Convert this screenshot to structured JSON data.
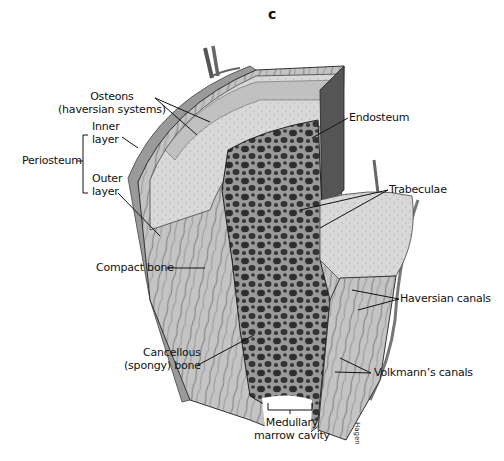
{
  "figure": {
    "panel_letter": "c",
    "colors": {
      "background": "#ffffff",
      "compact_bone": "#c9c9c9",
      "cut_surface": "#dcdcdc",
      "spongy_dark": "#3a3a3a",
      "periosteum": "#8a8a8a",
      "leader_lines": "#111111"
    }
  },
  "labels": {
    "osteons": {
      "line1": "Osteons",
      "line2": "(haversian systems)"
    },
    "periosteum": "Periosteum",
    "inner_layer": {
      "line1": "Inner",
      "line2": "layer"
    },
    "outer_layer": {
      "line1": "Outer",
      "line2": "layer"
    },
    "endosteum": "Endosteum",
    "trabeculae": "Trabeculae",
    "compact_bone": "Compact bone",
    "haversian_canals": "Haversian canals",
    "cancellous": {
      "line1": "Cancellous",
      "line2": "(spongy) bone"
    },
    "volkmanns_canals": "Volkmann’s canals",
    "medullary": {
      "line1": "Medullary",
      "line2": "marrow cavity"
    }
  },
  "artist_signature": "Hagen"
}
